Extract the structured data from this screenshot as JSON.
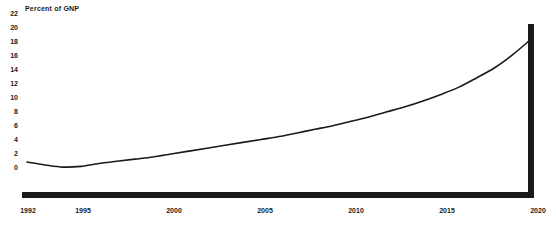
{
  "chart_data": {
    "type": "line",
    "title": "Percent of GNP",
    "xlabel": "",
    "ylabel": "Percent of GNP",
    "xlim": [
      1992,
      2020
    ],
    "ylim": [
      0,
      22
    ],
    "grid": false,
    "legend": "none",
    "y_ticks": [
      22,
      20,
      18,
      16,
      14,
      12,
      10,
      8,
      6,
      4,
      2,
      0
    ],
    "x_ticks": [
      1992,
      1995,
      2000,
      2005,
      2010,
      2015,
      2020
    ],
    "x_tick_labels": [
      "1992",
      "1995",
      "2000",
      "2005",
      "2010",
      "2015",
      "2020"
    ],
    "y_tick_labels": [
      "22",
      "20",
      "18",
      "16",
      "14",
      "12",
      "10",
      "8",
      "6",
      "4",
      "2",
      "0"
    ],
    "series": [
      {
        "name": "Percent of GNP",
        "color": "#1a1a1a",
        "x": [
          1992,
          1993,
          1994,
          1995,
          1996,
          1997,
          1998,
          1999,
          2000,
          2001,
          2002,
          2003,
          2004,
          2005,
          2006,
          2007,
          2008,
          2009,
          2010,
          2011,
          2012,
          2013,
          2014,
          2015,
          2016,
          2017,
          2018,
          2019,
          2020
        ],
        "values": [
          4.4,
          4.0,
          3.7,
          3.8,
          4.2,
          4.5,
          4.8,
          5.1,
          5.5,
          5.9,
          6.3,
          6.7,
          7.1,
          7.5,
          7.9,
          8.4,
          8.9,
          9.4,
          10.0,
          10.6,
          11.3,
          12.0,
          12.8,
          13.7,
          14.7,
          16.0,
          17.4,
          19.2,
          21.3
        ]
      }
    ],
    "annotations": {
      "terminal_drop": {
        "year": 2020,
        "from": 21.3,
        "to": 0
      }
    }
  },
  "axis": {
    "baseline_color": "#1a1a1a",
    "line_color": "#1a1a1a"
  }
}
